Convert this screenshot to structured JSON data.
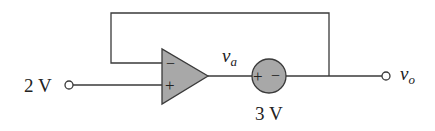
{
  "diagram": {
    "type": "circuit",
    "colors": {
      "wire": "#3a3a3a",
      "opamp_fill": "#a8a8a8",
      "source_fill": "#a8a8a8",
      "text": "#222222"
    },
    "input": {
      "label": "2 V"
    },
    "opamp": {
      "inverting_sign": "−",
      "noninverting_sign": "+"
    },
    "node_va": {
      "label_main": "v",
      "label_sub": "a"
    },
    "source": {
      "label": "3 V",
      "plus_sign": "+",
      "minus_sign": "−"
    },
    "output": {
      "label_main": "v",
      "label_sub": "o"
    }
  }
}
